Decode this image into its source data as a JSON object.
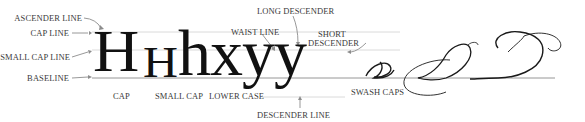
{
  "diagram": {
    "left_labels": [
      {
        "id": "ascender",
        "text": "ASCENDER LINE"
      },
      {
        "id": "cap",
        "text": "CAP LINE"
      },
      {
        "id": "small_cap",
        "text": "SMALL CAP LINE"
      },
      {
        "id": "baseline",
        "text": "BASELINE"
      }
    ],
    "top_labels": {
      "waist_line": "WAIST LINE",
      "long_descender": "LONG DESCENDER",
      "short_descender_1": "SHORT",
      "short_descender_2": "DESCENDER"
    },
    "bottom_labels": {
      "cap": "CAP",
      "small_cap": "SMALL CAP",
      "lower_case": "LOWER CASE",
      "swash_caps": "SWASH CAPS",
      "descender_line": "DESCENDER LINE"
    },
    "sample_glyphs": {
      "cap": "H",
      "small_cap": "H",
      "lower": "hxyy"
    },
    "swash_sample": "D D D",
    "colors": {
      "guide_line": "#bdbdbd",
      "baseline": "#8a8a8a",
      "arrow": "#8c8c8c",
      "glyph": "#111111",
      "label": "#3a3a3a"
    }
  }
}
